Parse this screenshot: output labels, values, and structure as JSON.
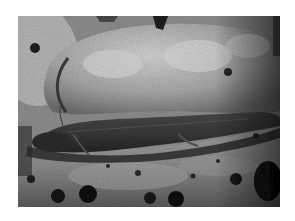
{
  "image": {
    "subject": "lungfish resting on rocks",
    "style": "grayscale photograph",
    "colors": {
      "background": "#ffffff",
      "rock_light": "#c8c8c8",
      "rock_mid": "#9a9a9a",
      "rock_dark": "#5e5e5e",
      "fish": "#3a3a3a",
      "shadow": "#111111"
    }
  }
}
